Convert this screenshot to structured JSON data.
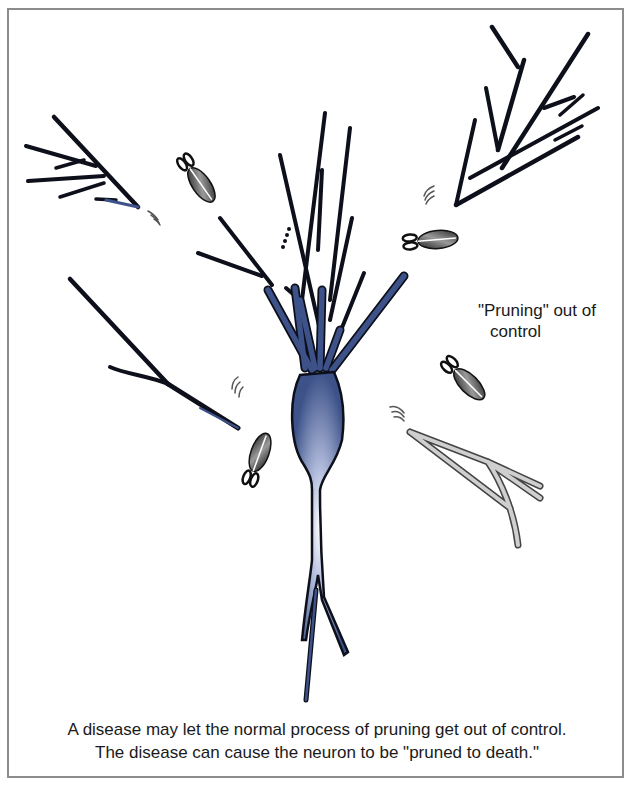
{
  "figure": {
    "annotation": {
      "line1": "\"Pruning\" out of",
      "line2": "control"
    },
    "caption": {
      "line1": "A disease may let the normal process of pruning get out of control.",
      "line2": "The disease can cause the neuron to be \"pruned to death.\""
    },
    "colors": {
      "neuron_fill": "#3d5289",
      "neuron_highlight": "#ffffff",
      "outline": "#0d0f1a",
      "dead_branch": "#c8c8c8",
      "frame": "#8c8c8c"
    },
    "elements": {
      "central_neuron": "neuron-cell-body with dendrites and axon",
      "severed_branches": [
        "top-left",
        "top-right",
        "middle-left",
        "right-dead-gray"
      ],
      "scissors": [
        "scissors-top-left",
        "scissors-upper-right",
        "scissors-lower-left",
        "scissors-right"
      ],
      "motion_marks": 5
    }
  }
}
